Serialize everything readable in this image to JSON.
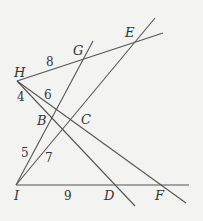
{
  "diagram": {
    "points": {
      "H": {
        "label": "H",
        "x": 17,
        "y": 81
      },
      "G": {
        "label": "G",
        "x": 83,
        "y": 58
      },
      "E": {
        "label": "E",
        "x": 135,
        "y": 42
      },
      "B": {
        "label": "B",
        "x": 55,
        "y": 115
      },
      "C": {
        "label": "C",
        "x": 71,
        "y": 119
      },
      "I": {
        "label": "I",
        "x": 16,
        "y": 185
      },
      "D": {
        "label": "D",
        "x": 117,
        "y": 185
      },
      "F": {
        "label": "F",
        "x": 161,
        "y": 185
      }
    },
    "segment_labels": {
      "HG": "8",
      "HB": "6",
      "HI": "4",
      "IB": "5",
      "IC": "7",
      "ID": "9"
    }
  }
}
